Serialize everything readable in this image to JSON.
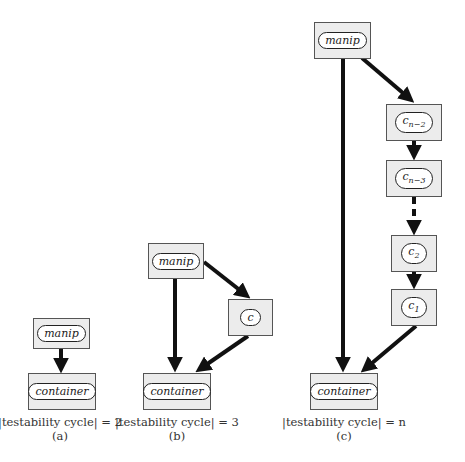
{
  "diagrams": {
    "a": {
      "nodes": {
        "manip": "manip",
        "container": "container"
      },
      "caption": "|testability cycle| = 2",
      "label": "(a)"
    },
    "b": {
      "nodes": {
        "manip": "manip",
        "c": "c",
        "container": "container"
      },
      "caption": "|testability cycle| = 3",
      "label": "(b)"
    },
    "c": {
      "nodes": {
        "manip": "manip",
        "cn2_base": "c",
        "cn2_sub": "n−2",
        "cn3_base": "c",
        "cn3_sub": "n−3",
        "c2_base": "c",
        "c2_sub": "2",
        "c1_base": "c",
        "c1_sub": "1",
        "container": "container"
      },
      "caption": "|testability cycle| = n",
      "label": "(c)"
    }
  }
}
